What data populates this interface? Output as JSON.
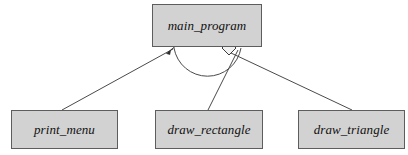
{
  "diagram": {
    "type": "structure-chart",
    "canvas": {
      "width": 408,
      "height": 155,
      "background": "#ffffff"
    },
    "style": {
      "node_fill": "#d2d2d2",
      "node_border": "#5d5d5d",
      "edge_color": "#4a4a4a",
      "text_color": "#101010"
    },
    "nodes": [
      {
        "id": "main_program",
        "label": "main_program",
        "role": "root-module",
        "x": 152,
        "y": 4,
        "width": 110,
        "height": 43
      },
      {
        "id": "print_menu",
        "label": "print_menu",
        "role": "child-module",
        "x": 11,
        "y": 110,
        "width": 107,
        "height": 39
      },
      {
        "id": "draw_rectangle",
        "label": "draw_rectangle",
        "role": "child-module",
        "x": 155,
        "y": 110,
        "width": 108,
        "height": 39
      },
      {
        "id": "draw_triangle",
        "label": "draw_triangle",
        "role": "child-module",
        "x": 298,
        "y": 110,
        "width": 107,
        "height": 39
      }
    ],
    "edges": [
      {
        "id": "edge-main-print-menu",
        "from": "main_program",
        "to": "print_menu",
        "x1": 173,
        "y1": 49,
        "x2": 62,
        "y2": 110,
        "decoration": "filled-arrowhead",
        "decoration_at": "from"
      },
      {
        "id": "edge-main-draw-rectangle",
        "from": "main_program",
        "to": "draw_rectangle",
        "x1": 238,
        "y1": 50,
        "x2": 208,
        "y2": 110,
        "decoration": "none",
        "decoration_at": "none"
      },
      {
        "id": "edge-main-draw-triangle",
        "from": "main_program",
        "to": "draw_triangle",
        "x1": 231,
        "y1": 53,
        "x2": 352,
        "y2": 110,
        "decoration": "hollow-diamond",
        "decoration_at": "from"
      }
    ],
    "annotations": [
      {
        "id": "iteration-arc",
        "kind": "iteration-arc",
        "description": "semicircular arc spanning the child invocations",
        "start_x": 174,
        "start_y": 48,
        "end_x": 241,
        "end_y": 48,
        "sweep_depth": 34
      },
      {
        "id": "aggregation-diamond",
        "kind": "hollow-diamond",
        "cx": 229,
        "cy": 48,
        "rx": 7,
        "ry": 7
      },
      {
        "id": "call-arrowhead",
        "kind": "filled-arrowhead",
        "tip_x": 175,
        "tip_y": 47,
        "angle_deg": -29
      }
    ]
  }
}
